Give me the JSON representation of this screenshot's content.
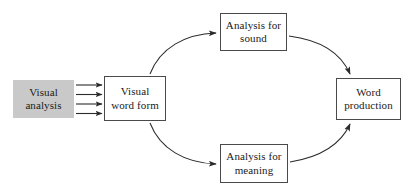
{
  "diagram": {
    "background_color": "#ffffff",
    "stroke_color": "#4a4a4a",
    "fill_gray": "#c9c9c9",
    "text_color": "#1a1a1a",
    "nodes": [
      {
        "id": "visual-analysis",
        "label": "Visual\nanalysis",
        "shape": "rectangle",
        "style": "filled-gray-no-border",
        "x": 13,
        "y": 80,
        "width": 61,
        "height": 38
      },
      {
        "id": "visual-word-form",
        "label": "Visual\nword form",
        "shape": "rectangle",
        "style": "outlined-white",
        "x": 104,
        "y": 76,
        "width": 62,
        "height": 45
      },
      {
        "id": "analysis-sound",
        "label": "Analysis for\nsound",
        "shape": "rectangle",
        "style": "outlined-white",
        "x": 220,
        "y": 13,
        "width": 67,
        "height": 38
      },
      {
        "id": "analysis-meaning",
        "label": "Analysis for\nmeaning",
        "shape": "rectangle",
        "style": "outlined-white",
        "x": 220,
        "y": 144,
        "width": 68,
        "height": 39
      },
      {
        "id": "word-production",
        "label": "Word\nproduction",
        "shape": "rectangle",
        "style": "outlined-white",
        "x": 336,
        "y": 78,
        "width": 65,
        "height": 42
      }
    ],
    "edges": [
      {
        "id": "edge-va-vwf-1",
        "from": "visual-analysis",
        "to": "visual-word-form",
        "style": "straight-arrow",
        "label": ""
      },
      {
        "id": "edge-va-vwf-2",
        "from": "visual-analysis",
        "to": "visual-word-form",
        "style": "straight-arrow",
        "label": ""
      },
      {
        "id": "edge-va-vwf-3",
        "from": "visual-analysis",
        "to": "visual-word-form",
        "style": "straight-arrow",
        "label": ""
      },
      {
        "id": "edge-va-vwf-4",
        "from": "visual-analysis",
        "to": "visual-word-form",
        "style": "straight-arrow",
        "label": ""
      },
      {
        "id": "edge-vwf-sound",
        "from": "visual-word-form",
        "to": "analysis-sound",
        "style": "curved-arrow",
        "label": ""
      },
      {
        "id": "edge-vwf-meaning",
        "from": "visual-word-form",
        "to": "analysis-meaning",
        "style": "curved-arrow",
        "label": ""
      },
      {
        "id": "edge-sound-word",
        "from": "analysis-sound",
        "to": "word-production",
        "style": "curved-arrow",
        "label": ""
      },
      {
        "id": "edge-meaning-word",
        "from": "analysis-meaning",
        "to": "word-production",
        "style": "curved-arrow",
        "label": ""
      }
    ]
  }
}
